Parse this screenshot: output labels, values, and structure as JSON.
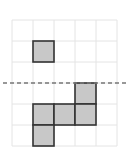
{
  "diagram": {
    "grid": {
      "cols": 5,
      "rows": 6,
      "origin_x": 12,
      "origin_y": 20,
      "cell": 21,
      "line_color": "#e4e4e4"
    },
    "filled_cells": [
      {
        "col": 1,
        "row": 1
      },
      {
        "col": 3,
        "row": 3
      },
      {
        "col": 1,
        "row": 4
      },
      {
        "col": 2,
        "row": 4
      },
      {
        "col": 3,
        "row": 4
      },
      {
        "col": 1,
        "row": 5
      }
    ],
    "fill_color": "#c8c8c8",
    "stroke_color": "#333333",
    "dashed_line": {
      "y": 83,
      "x1": 3,
      "x2": 128,
      "color": "#777777"
    }
  }
}
